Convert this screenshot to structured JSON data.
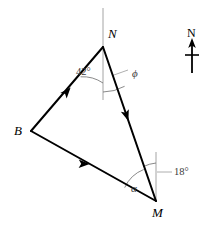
{
  "figure": {
    "type": "bearing-triangle-diagram",
    "background_color": "#ffffff",
    "stroke_color": "#000000",
    "reference_line_color": "#9a9a9a",
    "annotation_color": "#3a3a3a",
    "width": 213,
    "height": 231
  },
  "vertices": [
    {
      "id": "N",
      "label": "N",
      "x": 103,
      "y": 47,
      "label_x": 108,
      "label_y": 27
    },
    {
      "id": "B",
      "label": "B",
      "x": 31,
      "y": 131,
      "label_x": 14,
      "label_y": 124
    },
    {
      "id": "M",
      "label": "M",
      "x": 156,
      "y": 201,
      "label_x": 152,
      "label_y": 206
    }
  ],
  "edges": [
    {
      "id": "N-B",
      "from": "N",
      "to": "B",
      "arrow_direction": "toward-B",
      "arrow_position": 0.45
    },
    {
      "id": "B-M",
      "from": "B",
      "to": "M",
      "arrow_direction": "toward-B",
      "arrow_position": 0.47
    },
    {
      "id": "M-N",
      "from": "M",
      "to": "N",
      "arrow_direction": "toward-N",
      "arrow_position": 0.52
    }
  ],
  "north_lines": [
    {
      "id": "north-at-N",
      "x": 103,
      "y_top": 8,
      "y_bottom": 100
    },
    {
      "id": "north-at-M",
      "x": 156,
      "y_top": 152,
      "y_bottom": 201
    }
  ],
  "angles": [
    {
      "id": "angle-42",
      "label": "42°",
      "at_vertex": "N",
      "value": 42,
      "unit": "degrees",
      "label_x": 76,
      "label_y": 67,
      "has_leader": false
    },
    {
      "id": "angle-phi",
      "label": "ϕ",
      "at_vertex": "N",
      "value": null,
      "unit": "symbol",
      "label_x": 132,
      "label_y": 68,
      "has_leader": true
    },
    {
      "id": "angle-alpha",
      "label": "α",
      "at_vertex": "M",
      "value": null,
      "unit": "symbol",
      "label_x": 131,
      "label_y": 183,
      "has_leader": false
    },
    {
      "id": "angle-18",
      "label": "18°",
      "at_vertex": "M",
      "value": 18,
      "unit": "degrees",
      "label_x": 174,
      "label_y": 167,
      "has_leader": true
    }
  ],
  "compass": {
    "id": "compass-rose",
    "letter": "N",
    "letter_x": 187,
    "letter_y": 27,
    "arrow_x": 192,
    "arrow_top": 41,
    "arrow_bottom": 73,
    "crossbar_y": 55,
    "crossbar_half_width": 7
  }
}
